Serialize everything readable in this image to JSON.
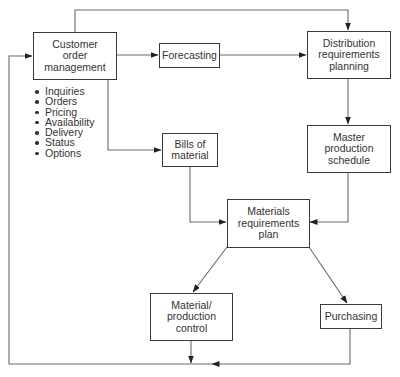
{
  "diagram": {
    "type": "flowchart",
    "nodes": {
      "customer_order_management": {
        "label": "Customer\norder\nmanagement"
      },
      "forecasting": {
        "label": "Forecasting"
      },
      "distribution_requirements_planning": {
        "label": "Distribution\nrequirements\nplanning"
      },
      "master_production_schedule": {
        "label": "Master\nproduction\nschedule"
      },
      "bills_of_material": {
        "label": "Bills of\nmaterial"
      },
      "materials_requirements_plan": {
        "label": "Materials\nrequirements\nplan"
      },
      "material_production_control": {
        "label": "Material/\nproduction\ncontrol"
      },
      "purchasing": {
        "label": "Purchasing"
      }
    },
    "customer_order_functions": [
      "Inquiries",
      "Orders",
      "Pricing",
      "Availability",
      "Delivery",
      "Status",
      "Options"
    ],
    "edges": [
      {
        "from": "Customer order management",
        "to": "Forecasting"
      },
      {
        "from": "Customer order management",
        "to": "Distribution requirements planning"
      },
      {
        "from": "Customer order management",
        "to": "Bills of material"
      },
      {
        "from": "Forecasting",
        "to": "Distribution requirements planning"
      },
      {
        "from": "Distribution requirements planning",
        "to": "Master production schedule"
      },
      {
        "from": "Master production schedule",
        "to": "Materials requirements plan"
      },
      {
        "from": "Bills of material",
        "to": "Materials requirements plan"
      },
      {
        "from": "Materials requirements plan",
        "to": "Material/production control"
      },
      {
        "from": "Materials requirements plan",
        "to": "Purchasing"
      },
      {
        "from": "Material/production control",
        "to": "Customer order management (feedback loop)"
      },
      {
        "from": "Purchasing",
        "to": "Customer order management (feedback loop)"
      }
    ],
    "colors": {
      "line": "#555555",
      "box_border": "#3a3a3a",
      "text": "#333333",
      "background": "#ffffff"
    }
  }
}
